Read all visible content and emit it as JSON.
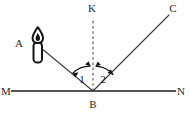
{
  "diagram": {
    "background_color": "#ffffff",
    "line_color": "#3a3a3a",
    "mirror_color": "#545454",
    "normal_color": "#777777",
    "label_color": "#2b2b2b",
    "labels": {
      "source_point": "A",
      "normal_top": "K",
      "reflected_end": "C",
      "mirror_left": "M",
      "mirror_right": "N",
      "vertex": "B",
      "angle_one": "1",
      "angle_two": "2"
    },
    "elements": {
      "mirror_name": "mirror-surface-line",
      "normal_name": "normal-dashed-line",
      "incident_name": "incident-ray",
      "reflected_name": "reflected-ray",
      "candle_name": "candle-light-source",
      "flame_name": "candle-flame",
      "arc_one_name": "angle-of-incidence-arc",
      "arc_two_name": "angle-of-reflection-arc"
    },
    "geometry": {
      "vertex_x": 93,
      "vertex_y": 91,
      "mirror_x1": 11,
      "mirror_x2": 176,
      "normal_top_y": 18,
      "incident_start_x": 40,
      "incident_start_y": 47,
      "reflected_end_x": 169,
      "reflected_end_y": 15
    }
  }
}
